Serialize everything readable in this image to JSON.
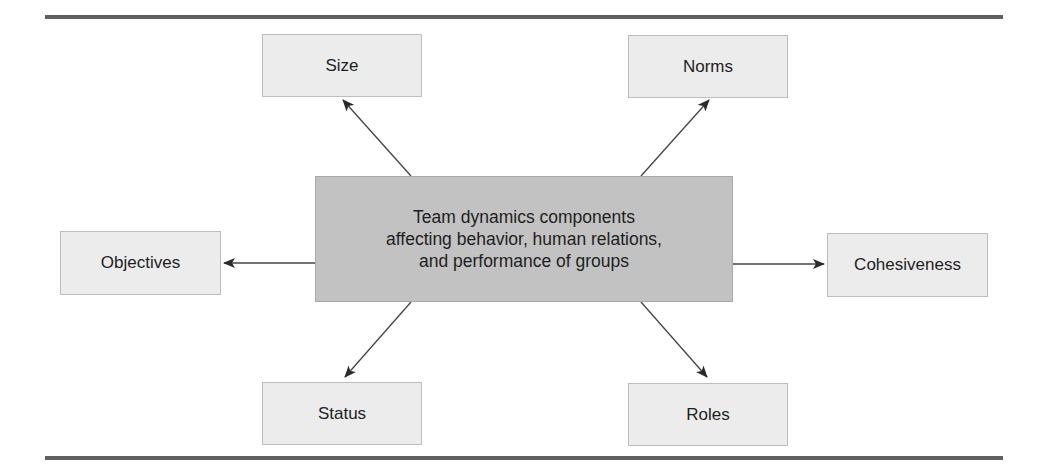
{
  "diagram": {
    "center": {
      "lines": [
        "Team dynamics components",
        "affecting behavior, human relations,",
        "and performance of groups"
      ]
    },
    "components": {
      "size": "Size",
      "norms": "Norms",
      "objectives": "Objectives",
      "cohesiveness": "Cohesiveness",
      "status": "Status",
      "roles": "Roles"
    },
    "colors": {
      "center_fill": "#c2c2c2",
      "leaf_fill": "#ececec",
      "rule": "#5f5f5f",
      "arrow": "#2a2a2a"
    }
  }
}
